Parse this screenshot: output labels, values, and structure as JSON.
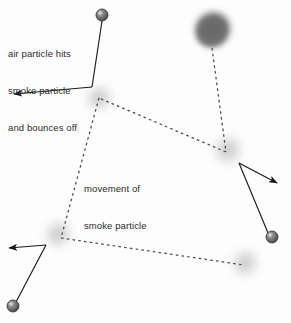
{
  "diagram": {
    "background_color": "#fdfdfd",
    "width": 291,
    "height": 323,
    "labels": {
      "collision": {
        "name": "air-particle-collision-label",
        "line1": "air particle hits",
        "line2": "smoke particle",
        "line3": "and bounces off",
        "color": "#2b2b2b",
        "x": 8,
        "y": 24
      },
      "movement": {
        "name": "smoke-particle-movement-label",
        "line1": "movement of",
        "line2": "smoke particle",
        "color": "#2b2b2b",
        "x": 84,
        "y": 159
      }
    },
    "colors": {
      "air_particle_fill": "#6e6e6e",
      "air_particle_highlight": "#b9b9b9",
      "air_particle_stroke": "#3a3a3a",
      "smoke_light": "#cfcfcf",
      "smoke_dark": "#6d6d6d",
      "path_dash": "#4a4a4a",
      "arrow": "#1a1a1a"
    },
    "smoke_particles": [
      {
        "id": "smoke-dark-top",
        "x": 212,
        "y": 31,
        "r": 20,
        "shade": "dark",
        "label": "smoke particle (start, dark)"
      },
      {
        "id": "smoke-upper-left",
        "x": 99,
        "y": 98,
        "r": 17,
        "shade": "light",
        "label": "smoke particle"
      },
      {
        "id": "smoke-right-mid",
        "x": 228,
        "y": 150,
        "r": 19,
        "shade": "light",
        "label": "smoke particle"
      },
      {
        "id": "smoke-lower-left",
        "x": 58,
        "y": 234,
        "r": 18,
        "shade": "light",
        "label": "smoke particle"
      },
      {
        "id": "smoke-lower-right",
        "x": 245,
        "y": 263,
        "r": 18,
        "shade": "light",
        "label": "smoke particle"
      }
    ],
    "air_particles": [
      {
        "id": "air-top",
        "x": 102,
        "y": 15,
        "r": 6
      },
      {
        "id": "air-right",
        "x": 272,
        "y": 237,
        "r": 6
      },
      {
        "id": "air-bottom-left",
        "x": 13,
        "y": 306,
        "r": 6
      }
    ],
    "motion_path": {
      "name": "smoke-particle-path",
      "style": "dashed",
      "points": [
        {
          "x": 212,
          "y": 46
        },
        {
          "x": 226,
          "y": 152
        },
        {
          "x": 99,
          "y": 98
        },
        {
          "x": 61,
          "y": 238
        },
        {
          "x": 244,
          "y": 265
        }
      ],
      "order_note": "dark blob -> right-mid blob; right-mid -> upper-left; upper-left -> lower-left; lower-left -> lower-right"
    },
    "collision_arrows": [
      {
        "id": "collision-top-left",
        "incoming": {
          "from_x": 102,
          "from_y": 21,
          "to_x": 92,
          "to_y": 87
        },
        "outgoing": {
          "from_x": 92,
          "from_y": 87,
          "to_x": 11,
          "to_y": 95
        }
      },
      {
        "id": "collision-right",
        "incoming": {
          "from_x": 268,
          "from_y": 233,
          "to_x": 239,
          "to_y": 163
        },
        "outgoing": {
          "from_x": 239,
          "from_y": 163,
          "to_x": 279,
          "to_y": 184
        }
      },
      {
        "id": "collision-bottom-left",
        "incoming": {
          "from_x": 16,
          "from_y": 302,
          "to_x": 46,
          "to_y": 245
        },
        "outgoing": {
          "from_x": 46,
          "from_y": 245,
          "to_x": 6,
          "to_y": 248
        }
      }
    ]
  }
}
